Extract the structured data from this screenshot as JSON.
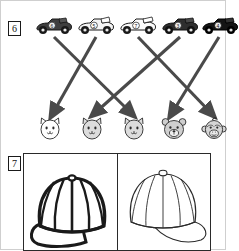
{
  "page": {
    "background_color": "#ffffff",
    "ink_color": "#1a1a1a",
    "line_color": "#4a4a4a"
  },
  "exercises": [
    {
      "number": "6",
      "type": "matching",
      "instruction_visible": false,
      "top_row": {
        "label": "race-cars",
        "items": [
          {
            "name": "race-car-6",
            "number": "6",
            "body_color": "#3f3f3f",
            "x": 12
          },
          {
            "name": "race-car-5",
            "number": "5",
            "body_color": "#f2f2f2",
            "x": 54
          },
          {
            "name": "race-car-7",
            "number": "7",
            "body_color": "#fbfbfb",
            "x": 96
          },
          {
            "name": "race-car-3",
            "number": "3",
            "body_color": "#2e2e2e",
            "x": 138
          },
          {
            "name": "race-car-4",
            "number": "4",
            "body_color": "#141414",
            "x": 178
          }
        ]
      },
      "bottom_row": {
        "label": "animal-faces",
        "items": [
          {
            "name": "cat-face-white",
            "animal": "cat",
            "fill": "#ffffff",
            "x": 14
          },
          {
            "name": "cat-face-gray-1",
            "animal": "cat",
            "fill": "#dcdcdc",
            "x": 56
          },
          {
            "name": "cat-face-gray-2",
            "animal": "cat",
            "fill": "#dcdcdc",
            "x": 98
          },
          {
            "name": "bear-face",
            "animal": "bear",
            "fill": "#cfcfcf",
            "x": 138
          },
          {
            "name": "monkey-face",
            "animal": "monkey",
            "fill": "#d6d6d6",
            "x": 178
          }
        ]
      },
      "connections": [
        {
          "from": "race-car-6",
          "to": "cat-face-gray-2",
          "from_index": 0,
          "to_index": 2
        },
        {
          "from": "race-car-5",
          "to": "cat-face-white",
          "from_index": 1,
          "to_index": 0
        },
        {
          "from": "race-car-7",
          "to": "monkey-face",
          "from_index": 2,
          "to_index": 4
        },
        {
          "from": "race-car-3",
          "to": "cat-face-gray-1",
          "from_index": 3,
          "to_index": 1
        },
        {
          "from": "race-car-4",
          "to": "bear-face",
          "from_index": 4,
          "to_index": 3
        }
      ]
    },
    {
      "number": "7",
      "type": "picture-pair",
      "panels": [
        {
          "name": "cap-thick-outline",
          "stroke_width": "thick",
          "description": "baseball cap drawn with heavy outline"
        },
        {
          "name": "cap-thin-outline",
          "stroke_width": "thin",
          "description": "baseball cap drawn with light outline"
        }
      ]
    }
  ]
}
